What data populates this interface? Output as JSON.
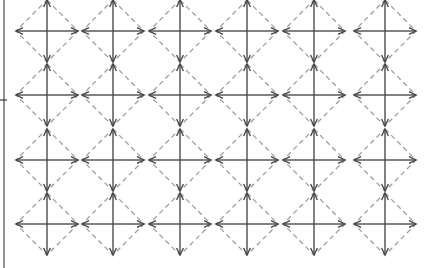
{
  "figure": {
    "width": 424,
    "height": 268,
    "background_color": "#ffffff"
  },
  "axis": {
    "name": "left-vertical-axis",
    "orientation": "vertical",
    "x": 4,
    "y_start": 0,
    "y_end": 268,
    "color": "#3a3a3e",
    "tick": {
      "name": "axis-tick-mark",
      "y": 100,
      "x_start": 0,
      "x_end": 7,
      "label": ""
    }
  },
  "grid": {
    "columns": 6,
    "rows": 4,
    "column_centers": [
      47,
      113,
      180,
      247,
      314,
      385
    ],
    "row_centers": [
      31,
      95,
      160,
      224
    ],
    "cell_radius": 31,
    "total_cells": 24
  },
  "cell": {
    "name": "diamond-arrow-cell",
    "outline_style": "dashed",
    "outline_color": "#9a9a9e",
    "outline_dash": "5 3.6",
    "arrow_color": "#45454a",
    "arrow_count": 4,
    "arrow_directions": [
      "up",
      "right",
      "down",
      "left"
    ],
    "arrow_head_length": 7,
    "arrow_head_half_width": 3.4,
    "vertex_offsets": {
      "top": [
        0,
        -31
      ],
      "right": [
        31,
        0
      ],
      "bottom": [
        0,
        31
      ],
      "left": [
        -31,
        0
      ]
    }
  },
  "chart_data": {
    "type": "scatter",
    "xlabel": "",
    "ylabel": "",
    "grid": false,
    "legend": "none",
    "categories": [
      "col-1",
      "col-2",
      "col-3",
      "col-4",
      "col-5",
      "col-6"
    ],
    "x": [
      47,
      113,
      180,
      247,
      314,
      385
    ],
    "y": [
      31,
      95,
      160,
      224
    ],
    "series": [
      {
        "name": "row-1",
        "values": [
          31,
          31,
          31,
          31,
          31,
          31
        ]
      },
      {
        "name": "row-2",
        "values": [
          95,
          95,
          95,
          95,
          95,
          95
        ]
      },
      {
        "name": "row-3",
        "values": [
          160,
          160,
          160,
          160,
          160,
          160
        ]
      },
      {
        "name": "row-4",
        "values": [
          224,
          224,
          224,
          224,
          224,
          224
        ]
      }
    ],
    "marker": "diamond-with-four-outward-arrows",
    "marker_size": 62,
    "xlim": [
      0,
      424
    ],
    "ylim": [
      268,
      0
    ]
  }
}
